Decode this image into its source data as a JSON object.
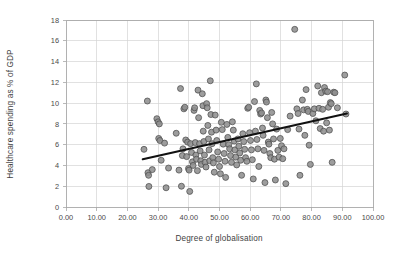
{
  "chart_data": {
    "type": "scatter",
    "title": "",
    "xlabel": "Degree of globalisation",
    "ylabel": "Healthcare spending as % of GDP",
    "xlim": [
      0,
      100
    ],
    "ylim": [
      0,
      18
    ],
    "grid": true,
    "legend": null,
    "xticks": [
      0,
      10,
      20,
      30,
      40,
      50,
      60,
      70,
      80,
      90,
      100
    ],
    "xtick_labels": [
      "0.00",
      "10.00",
      "20.00",
      "30.00",
      "40.00",
      "50.00",
      "60.00",
      "70.00",
      "80.00",
      "90.00",
      "100.00"
    ],
    "yticks": [
      0,
      2,
      4,
      6,
      8,
      10,
      12,
      14,
      16,
      18
    ],
    "ytick_labels": [
      "0",
      "2",
      "4",
      "6",
      "8",
      "10",
      "12",
      "14",
      "16",
      "18"
    ],
    "marker_color": "#8f8f8f",
    "marker_edge_color": "#4d4d4d",
    "trendline": {
      "color": "#111111",
      "x0": 25.0,
      "y0": 4.6,
      "x1": 91.5,
      "y1": 9.0
    },
    "points": [
      [
        25.4,
        5.55
      ],
      [
        26.5,
        10.2
      ],
      [
        26.7,
        3.3
      ],
      [
        26.9,
        3.05
      ],
      [
        27.0,
        1.98
      ],
      [
        28.1,
        3.6
      ],
      [
        29.6,
        8.5
      ],
      [
        30.0,
        8.2
      ],
      [
        30.2,
        6.6
      ],
      [
        30.4,
        8.0
      ],
      [
        30.6,
        6.4
      ],
      [
        31.0,
        4.5
      ],
      [
        32.1,
        6.15
      ],
      [
        32.6,
        1.85
      ],
      [
        33.4,
        3.75
      ],
      [
        35.9,
        7.1
      ],
      [
        36.8,
        3.55
      ],
      [
        37.3,
        11.4
      ],
      [
        37.6,
        2.0
      ],
      [
        37.9,
        4.95
      ],
      [
        38.1,
        5.6
      ],
      [
        38.4,
        9.45
      ],
      [
        38.7,
        9.6
      ],
      [
        39.0,
        6.45
      ],
      [
        39.3,
        4.85
      ],
      [
        39.6,
        6.25
      ],
      [
        39.9,
        3.7
      ],
      [
        40.1,
        3.55
      ],
      [
        40.3,
        1.5
      ],
      [
        40.6,
        6.1
      ],
      [
        40.9,
        5.25
      ],
      [
        41.2,
        4.35
      ],
      [
        41.4,
        4.0
      ],
      [
        41.7,
        9.3
      ],
      [
        41.9,
        9.55
      ],
      [
        42.1,
        6.2
      ],
      [
        42.3,
        5.0
      ],
      [
        42.5,
        4.6
      ],
      [
        42.8,
        3.5
      ],
      [
        43.0,
        11.25
      ],
      [
        43.2,
        8.6
      ],
      [
        43.5,
        6.1
      ],
      [
        43.7,
        5.4
      ],
      [
        43.9,
        4.45
      ],
      [
        44.1,
        4.1
      ],
      [
        44.4,
        10.9
      ],
      [
        44.6,
        9.75
      ],
      [
        44.7,
        7.3
      ],
      [
        44.9,
        6.3
      ],
      [
        45.1,
        5.0
      ],
      [
        45.3,
        4.3
      ],
      [
        45.6,
        3.85
      ],
      [
        45.8,
        9.95
      ],
      [
        46.0,
        9.55
      ],
      [
        46.2,
        7.85
      ],
      [
        46.4,
        6.55
      ],
      [
        46.6,
        5.5
      ],
      [
        46.8,
        4.45
      ],
      [
        47.0,
        12.15
      ],
      [
        47.2,
        8.9
      ],
      [
        47.4,
        7.2
      ],
      [
        47.6,
        6.1
      ],
      [
        47.8,
        4.75
      ],
      [
        48.0,
        4.25
      ],
      [
        48.3,
        3.35
      ],
      [
        48.6,
        8.85
      ],
      [
        48.9,
        7.4
      ],
      [
        49.1,
        6.4
      ],
      [
        49.4,
        5.3
      ],
      [
        49.7,
        4.6
      ],
      [
        50.0,
        3.9
      ],
      [
        50.3,
        3.2
      ],
      [
        50.6,
        8.15
      ],
      [
        50.9,
        7.45
      ],
      [
        51.2,
        6.05
      ],
      [
        51.5,
        5.15
      ],
      [
        51.8,
        4.4
      ],
      [
        52.0,
        2.85
      ],
      [
        52.4,
        7.95
      ],
      [
        52.7,
        6.7
      ],
      [
        53.0,
        6.0
      ],
      [
        53.3,
        5.6
      ],
      [
        53.6,
        4.95
      ],
      [
        53.9,
        4.3
      ],
      [
        54.2,
        8.2
      ],
      [
        54.5,
        7.4
      ],
      [
        54.8,
        6.35
      ],
      [
        55.0,
        5.5
      ],
      [
        55.3,
        4.8
      ],
      [
        55.6,
        4.05
      ],
      [
        56.0,
        6.55
      ],
      [
        56.3,
        5.85
      ],
      [
        56.6,
        5.2
      ],
      [
        56.9,
        4.5
      ],
      [
        57.2,
        3.05
      ],
      [
        57.6,
        7.05
      ],
      [
        57.9,
        6.3
      ],
      [
        58.2,
        5.55
      ],
      [
        58.5,
        4.75
      ],
      [
        58.9,
        4.4
      ],
      [
        59.2,
        9.5
      ],
      [
        59.5,
        9.6
      ],
      [
        59.8,
        7.15
      ],
      [
        60.1,
        6.4
      ],
      [
        60.4,
        5.5
      ],
      [
        60.7,
        4.55
      ],
      [
        61.0,
        2.7
      ],
      [
        61.4,
        10.15
      ],
      [
        61.7,
        7.3
      ],
      [
        62.0,
        11.85
      ],
      [
        62.2,
        6.5
      ],
      [
        62.5,
        5.6
      ],
      [
        62.8,
        3.9
      ],
      [
        63.1,
        9.3
      ],
      [
        63.4,
        8.95
      ],
      [
        63.7,
        9.05
      ],
      [
        64.0,
        7.6
      ],
      [
        64.2,
        6.9
      ],
      [
        64.5,
        5.45
      ],
      [
        64.8,
        2.35
      ],
      [
        65.1,
        10.3
      ],
      [
        65.3,
        10.1
      ],
      [
        65.6,
        8.6
      ],
      [
        65.9,
        6.25
      ],
      [
        66.1,
        6.05
      ],
      [
        66.4,
        5.15
      ],
      [
        66.7,
        4.75
      ],
      [
        67.0,
        9.1
      ],
      [
        67.3,
        8.0
      ],
      [
        67.6,
        6.55
      ],
      [
        67.9,
        4.6
      ],
      [
        68.2,
        2.6
      ],
      [
        68.6,
        7.5
      ],
      [
        69.0,
        5.45
      ],
      [
        69.4,
        4.8
      ],
      [
        69.8,
        6.6
      ],
      [
        70.2,
        5.9
      ],
      [
        70.6,
        4.65
      ],
      [
        71.0,
        5.6
      ],
      [
        71.6,
        2.25
      ],
      [
        72.2,
        7.45
      ],
      [
        73.0,
        8.75
      ],
      [
        74.5,
        17.1
      ],
      [
        75.2,
        9.45
      ],
      [
        75.6,
        9.0
      ],
      [
        75.9,
        7.5
      ],
      [
        76.2,
        3.05
      ],
      [
        77.0,
        10.3
      ],
      [
        77.4,
        9.35
      ],
      [
        77.8,
        6.9
      ],
      [
        78.2,
        11.3
      ],
      [
        78.6,
        9.4
      ],
      [
        78.9,
        9.2
      ],
      [
        79.2,
        5.95
      ],
      [
        79.6,
        4.1
      ],
      [
        80.4,
        9.0
      ],
      [
        80.9,
        9.45
      ],
      [
        81.4,
        8.3
      ],
      [
        82.0,
        11.65
      ],
      [
        82.4,
        9.5
      ],
      [
        82.8,
        7.55
      ],
      [
        83.2,
        11.0
      ],
      [
        83.6,
        9.4
      ],
      [
        83.9,
        7.3
      ],
      [
        84.2,
        11.5
      ],
      [
        84.6,
        11.15
      ],
      [
        84.9,
        8.1
      ],
      [
        85.2,
        11.1
      ],
      [
        85.5,
        9.6
      ],
      [
        85.8,
        7.4
      ],
      [
        86.1,
        10.05
      ],
      [
        86.4,
        9.95
      ],
      [
        86.7,
        4.3
      ],
      [
        87.2,
        11.05
      ],
      [
        87.6,
        11.0
      ],
      [
        88.4,
        9.55
      ],
      [
        90.8,
        12.7
      ],
      [
        91.2,
        8.95
      ]
    ]
  }
}
